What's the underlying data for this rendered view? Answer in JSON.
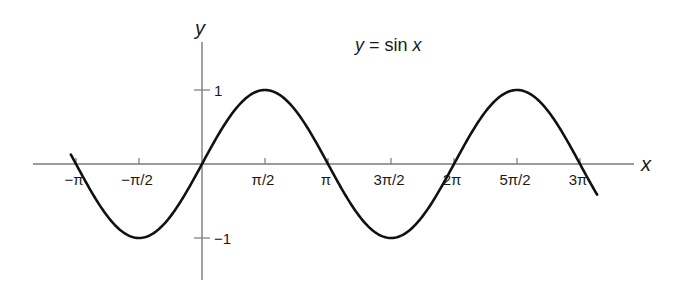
{
  "chart_data": {
    "type": "line",
    "title": "y = sin x",
    "title_parts": {
      "y": "y",
      "eq": " = sin ",
      "x": "x"
    },
    "xlabel": "x",
    "ylabel": "y",
    "function": "sin(x)",
    "xlim": [
      -3.27,
      4.15
    ],
    "xlim_note": "domain shown roughly from slightly left of -pi to slightly right of 3pi (radians/pi units approx -1.04 to 3.13)",
    "ylim": [
      -1,
      1
    ],
    "grid": false,
    "legend": false,
    "x_ticks": [
      {
        "value": -3.14159,
        "label": "−π"
      },
      {
        "value": -1.5708,
        "label": "−π/2"
      },
      {
        "value": 1.5708,
        "label": "π/2"
      },
      {
        "value": 3.14159,
        "label": "π"
      },
      {
        "value": 4.71239,
        "label": "3π/2"
      },
      {
        "value": 6.28319,
        "label": "2π"
      },
      {
        "value": 7.85398,
        "label": "5π/2"
      },
      {
        "value": 9.42478,
        "label": "3π"
      }
    ],
    "y_ticks": [
      {
        "value": 1,
        "label": "1"
      },
      {
        "value": -1,
        "label": "−1"
      }
    ],
    "series": [
      {
        "name": "sin x",
        "x": [
          -3.27,
          -3.14159,
          -1.5708,
          0,
          1.5708,
          3.14159,
          4.71239,
          6.28319,
          7.85398,
          9.42478,
          9.85
        ],
        "values": [
          0.13,
          0,
          -1,
          0,
          1,
          0,
          -1,
          0,
          1,
          0,
          -0.41
        ]
      }
    ]
  },
  "layout": {
    "origin_px": [
      202,
      164
    ],
    "half_pi_px": 63,
    "amplitude_px": 74,
    "x_range_units_of_pi": [
      -1.04,
      3.13
    ],
    "axis_color": "#7a7a7a",
    "curve_color": "#111111"
  }
}
